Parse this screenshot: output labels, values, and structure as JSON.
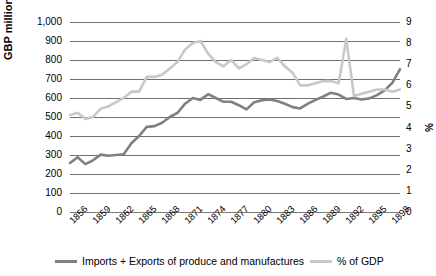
{
  "chart_data": {
    "type": "line",
    "title": "",
    "xlabel": "",
    "ylabel": "GBP million",
    "ylabel_right": "%",
    "grid": true,
    "legend_position": "bottom",
    "ylim": [
      0,
      1000
    ],
    "ylim_right": [
      0,
      9
    ],
    "yticks": [
      "1,000",
      "900",
      "800",
      "700",
      "600",
      "500",
      "400",
      "300",
      "200",
      "100",
      "0"
    ],
    "yticks_right": [
      "9",
      "8",
      "7",
      "6",
      "5",
      "4",
      "3",
      "2",
      "1",
      "0"
    ],
    "xticks": [
      "1856",
      "1859",
      "1862",
      "1865",
      "1868",
      "1871",
      "1874",
      "1877",
      "1880",
      "1883",
      "1886",
      "1889",
      "1892",
      "1895",
      "1898"
    ],
    "x": [
      1856,
      1857,
      1858,
      1859,
      1860,
      1861,
      1862,
      1863,
      1864,
      1865,
      1866,
      1867,
      1868,
      1869,
      1870,
      1871,
      1872,
      1873,
      1874,
      1875,
      1876,
      1877,
      1878,
      1879,
      1880,
      1881,
      1882,
      1883,
      1884,
      1885,
      1886,
      1887,
      1888,
      1889,
      1890,
      1891,
      1892,
      1893,
      1894,
      1895,
      1896,
      1897,
      1898,
      1899
    ],
    "series": [
      {
        "name": "Imports + Exports of produce and manufactures",
        "axis": "left",
        "color": "#808080",
        "units": "GBP million",
        "values": [
          258,
          288,
          252,
          272,
          302,
          296,
          300,
          304,
          362,
          400,
          448,
          452,
          470,
          500,
          522,
          570,
          600,
          590,
          620,
          600,
          580,
          580,
          562,
          540,
          578,
          588,
          592,
          584,
          570,
          552,
          545,
          570,
          590,
          608,
          628,
          618,
          595,
          600,
          592,
          598,
          615,
          640,
          680,
          752
        ]
      },
      {
        "name": "% of GDP",
        "axis": "right",
        "color": "#c8c8c8",
        "units": "%",
        "values": [
          4.6,
          4.7,
          4.4,
          4.5,
          4.9,
          5.0,
          5.2,
          5.4,
          5.7,
          5.7,
          6.4,
          6.4,
          6.5,
          6.8,
          7.1,
          7.7,
          8.0,
          8.1,
          7.5,
          7.1,
          6.9,
          7.2,
          6.8,
          7.0,
          7.3,
          7.2,
          7.1,
          7.3,
          6.9,
          6.6,
          6.0,
          6.0,
          6.1,
          6.2,
          6.2,
          6.1,
          8.2,
          5.5,
          5.6,
          5.7,
          5.8,
          5.8,
          5.7,
          5.8
        ]
      }
    ]
  },
  "axis": {
    "left_title": "GBP million",
    "right_title": "%"
  },
  "legend": {
    "items": [
      {
        "label": "Imports + Exports of produce and manufactures",
        "color": "#808080"
      },
      {
        "label": "% of GDP",
        "color": "#c8c8c8"
      }
    ]
  }
}
